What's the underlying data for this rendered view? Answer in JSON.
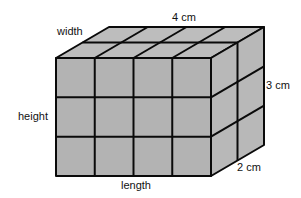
{
  "diagram": {
    "labels": {
      "width": "width",
      "height": "height",
      "length": "length",
      "top_dimension": "4 cm",
      "right_dimension": "3 cm",
      "depth_dimension": "2 cm"
    },
    "cubes": {
      "length": 4,
      "height": 3,
      "width": 2
    },
    "colors": {
      "face_fill": "#b3b3b3",
      "top_fill": "#bdbdbd",
      "side_fill": "#b8b8b8",
      "edge": "#0a0a0a",
      "background": "#ffffff"
    }
  }
}
